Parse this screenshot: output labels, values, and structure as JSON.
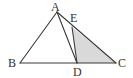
{
  "diagram": {
    "type": "triangle-geometry",
    "points": {
      "A": {
        "label": "A"
      },
      "B": {
        "label": "B"
      },
      "C": {
        "label": "C"
      },
      "D": {
        "label": "D",
        "on": "BC"
      },
      "E": {
        "label": "E",
        "on": "AC"
      }
    },
    "segments": [
      "AB",
      "BC",
      "CA",
      "AD",
      "DE"
    ],
    "shaded_region": {
      "vertices": [
        "E",
        "D",
        "C"
      ],
      "color": "#d9d9d9"
    },
    "line_color": "#3a3a3a",
    "label_color": "#333333"
  }
}
